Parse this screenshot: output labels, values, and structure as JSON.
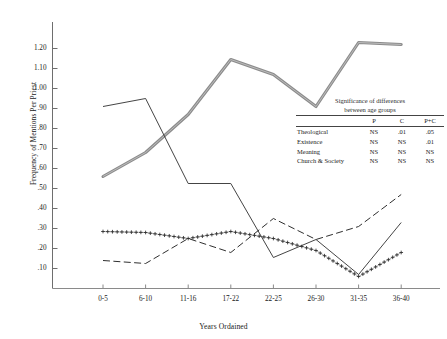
{
  "chart_data": {
    "type": "line",
    "title": "",
    "xlabel": "Years Ordained",
    "ylabel": "Frequency of Mentions Per Priest",
    "categories": [
      "0-5",
      "6-10",
      "11-16",
      "17-22",
      "22-25",
      "26-30",
      "31-35",
      "36-40"
    ],
    "yticks": [
      "1.20",
      "1.10",
      "1.00",
      ".90",
      ".80",
      ".70",
      ".60",
      ".50",
      ".40",
      ".30",
      ".20",
      ".10"
    ],
    "ylim": [
      0,
      1.27
    ],
    "grid": false,
    "legend_position": "none",
    "series": [
      {
        "name": "Theological",
        "style": "thick-gray-double",
        "color": "#8c8c8c",
        "values": [
          0.56,
          0.68,
          0.87,
          1.145,
          1.07,
          0.91,
          1.23,
          1.22
        ]
      },
      {
        "name": "Existence",
        "style": "thin-solid-dark",
        "color": "#3a3a3a",
        "values": [
          0.91,
          0.95,
          0.525,
          0.525,
          0.155,
          0.245,
          0.07,
          0.33
        ]
      },
      {
        "name": "Meaning",
        "style": "dashed-dark",
        "color": "#2f2f2f",
        "values": [
          0.14,
          0.125,
          0.25,
          0.18,
          0.35,
          0.245,
          0.31,
          0.47
        ]
      },
      {
        "name": "Church & Society",
        "style": "plus-markers",
        "color": "#2b2b2b",
        "values": [
          0.285,
          0.28,
          0.25,
          0.285,
          0.25,
          0.19,
          0.06,
          0.18
        ]
      }
    ]
  },
  "sig_table": {
    "caption_line1": "Significance of differences",
    "caption_line2": "between age groups",
    "columns": [
      "",
      "P",
      "C",
      "P+C"
    ],
    "rows": [
      {
        "label": "Theological",
        "P": "NS",
        "C": ".01",
        "PC": ".05"
      },
      {
        "label": "Existence",
        "P": "NS",
        "C": "NS",
        "PC": ".01"
      },
      {
        "label": "Meaning",
        "P": "NS",
        "C": "NS",
        "PC": "NS"
      },
      {
        "label": "Church & Society",
        "P": "NS",
        "C": "NS",
        "PC": "NS"
      }
    ]
  }
}
